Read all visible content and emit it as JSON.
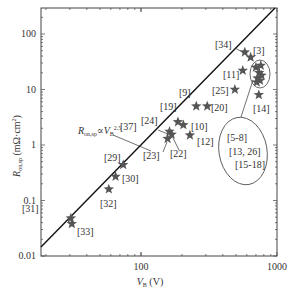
{
  "chart_data": {
    "type": "scatter",
    "title": "",
    "xlabel": "V_B (V)",
    "ylabel": "R_on,sp (mΩ·cm²)",
    "xscale": "log",
    "yscale": "log",
    "xlim": [
      18.4,
      1000
    ],
    "ylim": [
      0.01,
      280
    ],
    "x_ticks": [
      {
        "value": 100,
        "label": "100"
      },
      {
        "value": 1000,
        "label": "1000"
      }
    ],
    "y_ticks": [
      {
        "value": 0.01,
        "label": "0.01"
      },
      {
        "value": 0.1,
        "label": "0.1"
      },
      {
        "value": 1,
        "label": "1"
      },
      {
        "value": 10,
        "label": "10"
      },
      {
        "value": 100,
        "label": "100"
      }
    ],
    "grid": false,
    "legend": null,
    "trend_line": {
      "label": "R_on,sp ∝ V_B^2.5",
      "exponent": 2.5,
      "points": [
        [
          18.4,
          0.0145
        ],
        [
          1000,
          320
        ]
      ]
    },
    "series": [
      {
        "name": "reported devices",
        "marker": "star",
        "color": "#555555",
        "points": [
          {
            "ref": "[31]",
            "x": 30.5,
            "y": 0.048
          },
          {
            "ref": "[33]",
            "x": 31,
            "y": 0.038
          },
          {
            "ref": "[32]",
            "x": 58,
            "y": 0.16
          },
          {
            "ref": "[30]",
            "x": 65,
            "y": 0.27
          },
          {
            "ref": "[29]",
            "x": 74,
            "y": 0.44
          },
          {
            "ref": "[23]",
            "x": 157,
            "y": 1.3
          },
          {
            "ref": "[24]",
            "x": 162,
            "y": 1.75
          },
          {
            "ref": "[22]",
            "x": 168,
            "y": 1.55
          },
          {
            "ref": "[19]",
            "x": 187,
            "y": 2.6
          },
          {
            "ref": "[10]",
            "x": 205,
            "y": 2.3
          },
          {
            "ref": "[12]",
            "x": 229,
            "y": 1.5
          },
          {
            "ref": "[9]",
            "x": 255,
            "y": 5.0
          },
          {
            "ref": "[20]",
            "x": 307,
            "y": 5.0
          },
          {
            "ref": "[25]",
            "x": 490,
            "y": 10
          },
          {
            "ref": "[11]",
            "x": 560,
            "y": 22
          },
          {
            "ref": "[14]",
            "x": 735,
            "y": 8
          },
          {
            "ref": "[34]",
            "x": 580,
            "y": 47
          },
          {
            "ref": "[3]",
            "x": 640,
            "y": 38
          },
          {
            "ref": "[5-8],[13,26],[15-18]",
            "x": 700,
            "y": 25
          },
          {
            "ref": "[5-8],[13,26],[15-18]",
            "x": 740,
            "y": 20
          },
          {
            "ref": "[5-8],[13,26],[15-18]",
            "x": 720,
            "y": 16
          },
          {
            "ref": "[5-8],[13,26],[15-18]",
            "x": 760,
            "y": 27
          },
          {
            "ref": "[5-8],[13,26],[15-18]",
            "x": 770,
            "y": 18
          },
          {
            "ref": "[5-8],[13,26],[15-18]",
            "x": 710,
            "y": 13.5
          },
          {
            "ref": "[5-8],[13,26],[15-18]",
            "x": 750,
            "y": 14.5
          }
        ]
      }
    ],
    "annotations": [
      {
        "text": "[31]",
        "x": 22,
        "y": 212
      },
      {
        "text": "[33]",
        "x": 77,
        "y": 235
      },
      {
        "text": "[32]",
        "x": 100,
        "y": 207
      },
      {
        "text": "[30]",
        "x": 122,
        "y": 182
      },
      {
        "text": "[29]",
        "x": 104,
        "y": 161
      },
      {
        "text": "[23]",
        "x": 143,
        "y": 159
      },
      {
        "text": "[22]",
        "x": 170,
        "y": 157
      },
      {
        "text": "[37]",
        "x": 120,
        "y": 130
      },
      {
        "text": "[24]",
        "x": 141,
        "y": 124
      },
      {
        "text": "[10]",
        "x": 191,
        "y": 130
      },
      {
        "text": "[12]",
        "x": 197,
        "y": 145
      },
      {
        "text": "[19]",
        "x": 160,
        "y": 110
      },
      {
        "text": "[9]",
        "x": 179,
        "y": 96
      },
      {
        "text": "[20]",
        "x": 211,
        "y": 111
      },
      {
        "text": "[25]",
        "x": 212,
        "y": 94
      },
      {
        "text": "[11]",
        "x": 223,
        "y": 78
      },
      {
        "text": "[14]",
        "x": 253,
        "y": 112
      },
      {
        "text": "[34]",
        "x": 215,
        "y": 48
      },
      {
        "text": "[3]",
        "x": 253,
        "y": 54
      },
      {
        "text": "[5-8]",
        "x": 227,
        "y": 141
      },
      {
        "text": "[13, 26]",
        "x": 229,
        "y": 155
      },
      {
        "text": "[15-18]",
        "x": 235,
        "y": 168
      }
    ]
  }
}
